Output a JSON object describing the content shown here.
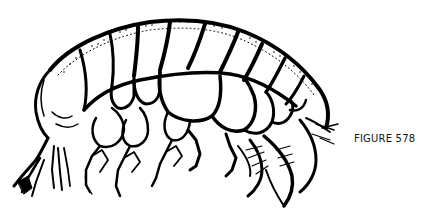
{
  "figure": {
    "caption": "FIGURE 578",
    "illustration": {
      "subject": "amphipod-crustacean-lateral-view",
      "style": "black-and-white line drawing",
      "ink_color": "#000000",
      "paper_color": "#ffffff"
    }
  }
}
